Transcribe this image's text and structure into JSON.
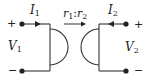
{
  "diagram": {
    "type": "ideal gyrator circuit symbol",
    "port1": {
      "current_label": "I",
      "current_sub": "1",
      "voltage_label": "V",
      "voltage_sub": "1",
      "plus": "+",
      "minus": "−"
    },
    "port2": {
      "current_label": "I",
      "current_sub": "2",
      "voltage_label": "V",
      "voltage_sub": "2",
      "plus": "+",
      "minus": "−"
    },
    "ratio": {
      "r1": "r",
      "r1_sub": "1",
      "sep": ":",
      "r2": "r",
      "r2_sub": "2"
    },
    "colors": {
      "stroke": "#333333",
      "text": "#222222"
    }
  }
}
